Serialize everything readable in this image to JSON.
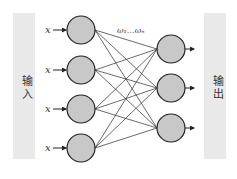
{
  "diagram": {
    "type": "neural-network",
    "input_panel": {
      "label": "输入"
    },
    "output_panel": {
      "label": "输出"
    },
    "input_label": "x",
    "weights_label": "ω₁…ωₙ",
    "input_nodes": [
      {
        "id": "in1",
        "label": "x"
      },
      {
        "id": "in2",
        "label": "x"
      },
      {
        "id": "in3",
        "label": "x"
      },
      {
        "id": "in4",
        "label": "x"
      }
    ],
    "output_nodes": [
      {
        "id": "out1"
      },
      {
        "id": "out2"
      },
      {
        "id": "out3"
      }
    ],
    "connections": "fully-connected (4 inputs × 3 outputs)",
    "colors": {
      "panel": "#e9e9e9",
      "node_fill": "#c8c8c8",
      "node_stroke": "#222222",
      "line": "#444444"
    }
  }
}
